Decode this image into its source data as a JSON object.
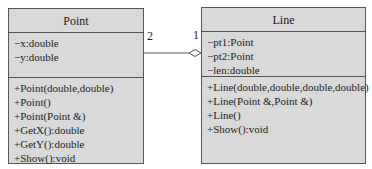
{
  "classes": {
    "point": {
      "name": "Point",
      "attributes": [
        "−x:double",
        "−y:double"
      ],
      "operations": [
        "+Point(double,double)",
        "+Point()",
        "+Point(Point &)",
        "+GetX():double",
        "+GetY():double",
        "+Show():void"
      ]
    },
    "line": {
      "name": "Line",
      "attributes": [
        "−pt1:Point",
        "−pt2:Point",
        "−len:double"
      ],
      "operations": [
        "+Line(double,double,double,double)",
        "+Line(Point &,Point &)",
        "+Line()",
        "+Show():void"
      ]
    }
  },
  "association": {
    "type": "aggregation",
    "point_multiplicity": "2",
    "line_multiplicity": "1"
  },
  "colors": {
    "box_fill": "#d9d9d9",
    "border": "#555555"
  }
}
